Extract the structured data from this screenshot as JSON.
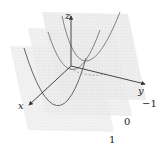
{
  "diagram": {
    "title": "",
    "axes": {
      "x_label": "x",
      "y_label": "y",
      "z_label": "z"
    },
    "plane_labels": [
      "-1",
      "0",
      "1"
    ],
    "plane_label_display": [
      "−1",
      "0",
      "1"
    ],
    "colors": {
      "plane_fill": "#e9e9e9",
      "plane_grid": "#d6d6d6",
      "curve": "#6e6e6e",
      "axis": "#333333",
      "label": "#222222"
    }
  }
}
